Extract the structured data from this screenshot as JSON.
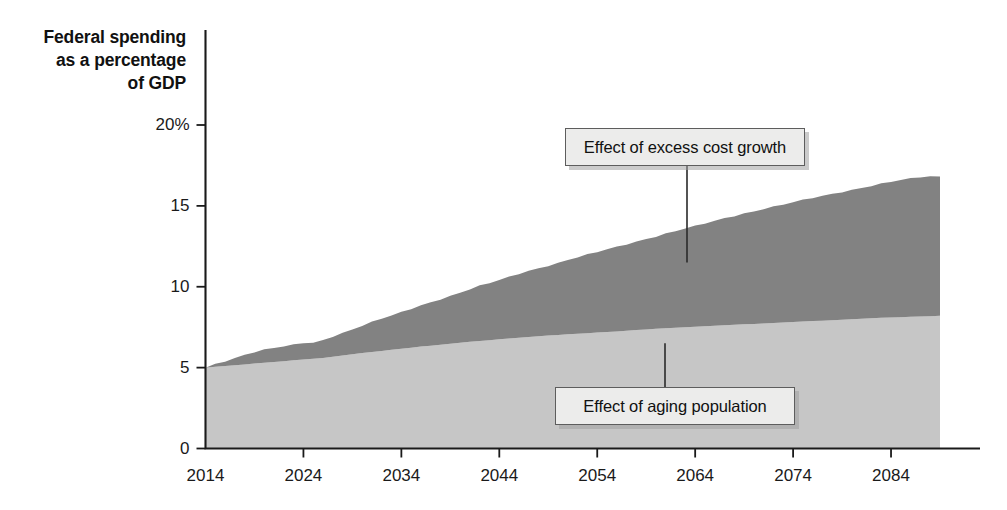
{
  "chart_data": {
    "type": "area",
    "title": "Federal spending as a percentage of GDP",
    "title_lines": [
      "Federal spending",
      "as a percentage",
      "of GDP"
    ],
    "xlabel": "",
    "ylabel": "Federal spending as a percentage of GDP",
    "stacked": true,
    "grid": false,
    "legend_position": "annotations-on-plot",
    "xlim": [
      2014,
      2089
    ],
    "ylim": [
      0,
      20
    ],
    "x_tick_labels": [
      "2014",
      "2024",
      "2034",
      "2044",
      "2054",
      "2064",
      "2074",
      "2084"
    ],
    "x_ticks": [
      2014,
      2024,
      2034,
      2044,
      2054,
      2064,
      2074,
      2084
    ],
    "y_tick_labels": [
      "0",
      "5",
      "10",
      "15",
      "20%"
    ],
    "y_ticks": [
      0,
      5,
      10,
      15,
      20
    ],
    "colors": {
      "aging": "#c6c6c6",
      "excess": "#828282",
      "axis": "#1a1a1a",
      "callout_fill": "#ececeb",
      "callout_border": "#5d5d5d"
    },
    "x": [
      2014,
      2015,
      2016,
      2017,
      2018,
      2019,
      2020,
      2021,
      2022,
      2023,
      2024,
      2025,
      2026,
      2027,
      2028,
      2029,
      2030,
      2031,
      2032,
      2033,
      2034,
      2035,
      2036,
      2037,
      2038,
      2039,
      2040,
      2041,
      2042,
      2043,
      2044,
      2045,
      2046,
      2047,
      2048,
      2049,
      2050,
      2051,
      2052,
      2053,
      2054,
      2055,
      2056,
      2057,
      2058,
      2059,
      2060,
      2061,
      2062,
      2063,
      2064,
      2065,
      2066,
      2067,
      2068,
      2069,
      2070,
      2071,
      2072,
      2073,
      2074,
      2075,
      2076,
      2077,
      2078,
      2079,
      2080,
      2081,
      2082,
      2083,
      2084,
      2085,
      2086,
      2087,
      2088,
      2089
    ],
    "series": [
      {
        "name": "Effect of aging population",
        "key": "aging",
        "color": "#c6c6c6",
        "values": [
          5.0,
          5.05,
          5.1,
          5.15,
          5.2,
          5.25,
          5.3,
          5.35,
          5.4,
          5.45,
          5.5,
          5.55,
          5.6,
          5.68,
          5.75,
          5.82,
          5.9,
          5.97,
          6.03,
          6.1,
          6.17,
          6.23,
          6.3,
          6.36,
          6.42,
          6.48,
          6.54,
          6.6,
          6.65,
          6.7,
          6.76,
          6.8,
          6.85,
          6.9,
          6.94,
          6.98,
          7.02,
          7.06,
          7.1,
          7.13,
          7.17,
          7.2,
          7.24,
          7.28,
          7.32,
          7.36,
          7.4,
          7.44,
          7.47,
          7.5,
          7.53,
          7.56,
          7.59,
          7.62,
          7.65,
          7.68,
          7.7,
          7.73,
          7.76,
          7.79,
          7.82,
          7.85,
          7.88,
          7.9,
          7.93,
          7.96,
          7.99,
          8.02,
          8.05,
          8.08,
          8.1,
          8.12,
          8.14,
          8.16,
          8.18,
          8.2
        ]
      },
      {
        "name": "Effect of excess cost growth",
        "key": "excess",
        "color": "#828282",
        "values": [
          0.0,
          0.18,
          0.3,
          0.45,
          0.6,
          0.72,
          0.8,
          0.86,
          0.9,
          0.95,
          1.02,
          0.98,
          1.1,
          1.25,
          1.4,
          1.55,
          1.7,
          1.85,
          2.0,
          2.12,
          2.25,
          2.4,
          2.55,
          2.68,
          2.82,
          2.95,
          3.1,
          3.25,
          3.4,
          3.52,
          3.65,
          3.8,
          3.95,
          4.08,
          4.2,
          4.33,
          4.45,
          4.6,
          4.72,
          4.85,
          4.97,
          5.1,
          5.22,
          5.35,
          5.47,
          5.6,
          5.72,
          5.85,
          5.97,
          6.1,
          6.22,
          6.35,
          6.47,
          6.6,
          6.72,
          6.85,
          6.97,
          7.1,
          7.2,
          7.3,
          7.4,
          7.5,
          7.6,
          7.7,
          7.8,
          7.9,
          8.0,
          8.1,
          8.2,
          8.3,
          8.4,
          8.48,
          8.55,
          8.6,
          8.62,
          8.6
        ]
      }
    ],
    "totals": [
      5.0,
      5.23,
      5.4,
      5.6,
      5.8,
      5.97,
      6.1,
      6.21,
      6.3,
      6.4,
      6.52,
      6.53,
      6.7,
      6.93,
      7.15,
      7.37,
      7.6,
      7.82,
      8.03,
      8.22,
      8.42,
      8.63,
      8.85,
      9.04,
      9.24,
      9.43,
      9.64,
      9.85,
      10.05,
      10.22,
      10.41,
      10.6,
      10.8,
      10.98,
      11.14,
      11.31,
      11.47,
      11.66,
      11.82,
      11.98,
      12.14,
      12.3,
      12.46,
      12.63,
      12.79,
      12.96,
      13.12,
      13.29,
      13.44,
      13.6,
      13.75,
      13.91,
      14.06,
      14.22,
      14.37,
      14.53,
      14.67,
      14.83,
      14.96,
      15.09,
      15.22,
      15.35,
      15.48,
      15.6,
      15.73,
      15.86,
      15.99,
      16.12,
      16.25,
      16.38,
      16.5,
      16.6,
      16.69,
      16.76,
      16.8,
      16.8
    ],
    "annotations": [
      {
        "id": "excess",
        "label": "Effect of excess cost growth",
        "points_to_year": 2062,
        "points_to_value": 11.5
      },
      {
        "id": "aging",
        "label": "Effect of aging population",
        "points_to_year": 2062,
        "points_to_value": 6.5
      }
    ]
  }
}
